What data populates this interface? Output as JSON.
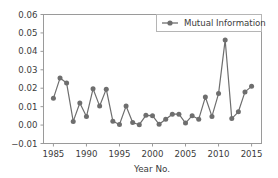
{
  "chart_data": {
    "type": "line",
    "title": "",
    "xlabel": "Year No.",
    "ylabel": "",
    "xlim": [
      1983.5,
      2016.5
    ],
    "ylim": [
      -0.01,
      0.06
    ],
    "xticks": [
      1985,
      1990,
      1995,
      2000,
      2005,
      2010,
      2015
    ],
    "xtick_labels": [
      "1985",
      "1990",
      "1995",
      "2000",
      "2005",
      "2010",
      "2015"
    ],
    "yticks": [
      -0.01,
      0.0,
      0.01,
      0.02,
      0.03,
      0.04,
      0.05,
      0.06
    ],
    "ytick_labels": [
      "−0.01",
      "0.00",
      "0.01",
      "0.02",
      "0.03",
      "0.04",
      "0.05",
      "0.06"
    ],
    "grid": false,
    "legend_position": "top-right",
    "series": [
      {
        "name": "Mutual Information",
        "color": "#6e6e6e",
        "marker": "circle",
        "x": [
          1985,
          1986,
          1987,
          1988,
          1989,
          1990,
          1991,
          1992,
          1993,
          1994,
          1995,
          1996,
          1997,
          1998,
          1999,
          2000,
          2001,
          2002,
          2003,
          2004,
          2005,
          2006,
          2007,
          2008,
          2009,
          2010,
          2011,
          2012,
          2013,
          2014,
          2015
        ],
        "values": [
          0.0145,
          0.0255,
          0.0228,
          0.002,
          0.012,
          0.0046,
          0.0197,
          0.0103,
          0.0195,
          0.0021,
          0.0003,
          0.0103,
          0.0014,
          0.0002,
          0.0053,
          0.0051,
          0.0004,
          0.0032,
          0.0059,
          0.0059,
          0.0011,
          0.0051,
          0.0032,
          0.0152,
          0.0047,
          0.0171,
          0.0462,
          0.0035,
          0.0072,
          0.018,
          0.021
        ]
      }
    ]
  },
  "legend": {
    "entries": [
      {
        "label": "Mutual Information"
      }
    ]
  },
  "axes": {
    "x_title": "Year No."
  }
}
